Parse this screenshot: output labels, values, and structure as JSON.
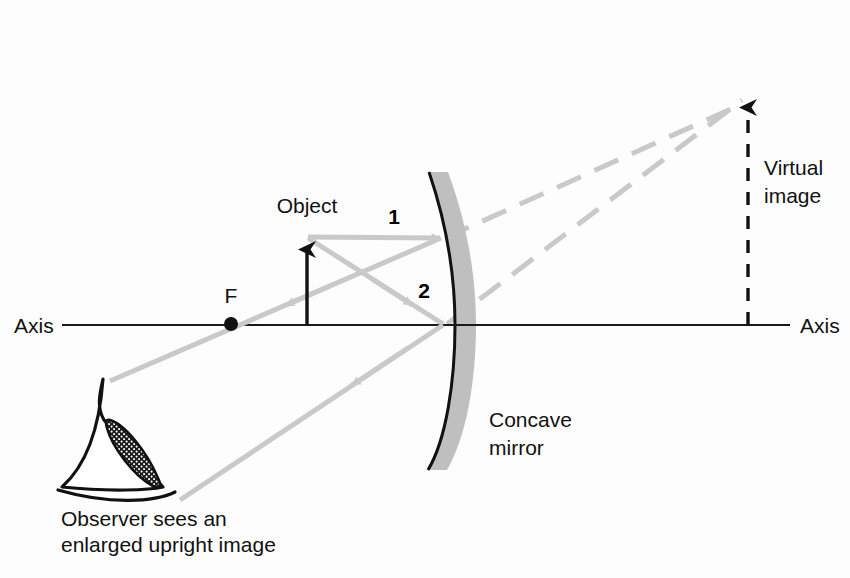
{
  "figure": {
    "background_color": "#fdfdfd",
    "ray_color": "#c9c9c9",
    "line_color": "#1a1a1a",
    "mirror_fill": "#bfbfbf"
  },
  "labels": {
    "axis_left": "Axis",
    "axis_right": "Axis",
    "focal_point": "F",
    "object": "Object",
    "ray_one": "1",
    "ray_two": "2",
    "mirror_line1": "Concave",
    "mirror_line2": "mirror",
    "virtual_image_line1": "Virtual",
    "virtual_image_line2": "image",
    "observer_line1": "Observer sees an",
    "observer_line2": "enlarged upright image"
  },
  "geometry": {
    "axis_y": 325,
    "axis_x_start": 62,
    "axis_x_end": 790,
    "focal_point_x": 231,
    "object_x": 307,
    "object_top_y": 237,
    "mirror_vertex_x": 443,
    "image_x": 748,
    "image_top_y": 95
  }
}
